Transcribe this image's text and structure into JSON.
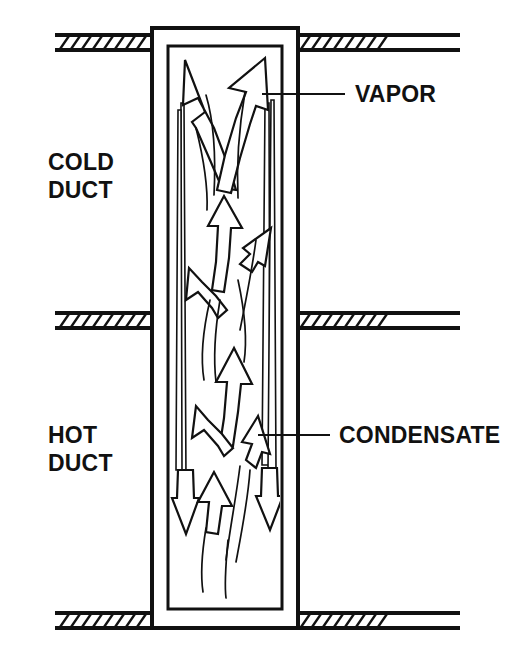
{
  "figure": {
    "background_color": "#ffffff",
    "line_color": "#111111"
  },
  "labels": {
    "cold_duct_line1": "COLD",
    "cold_duct_line2": "DUCT",
    "hot_duct_line1": "HOT",
    "hot_duct_line2": "DUCT",
    "vapor": "VAPOR",
    "condensate": "CONDENSATE"
  },
  "callouts": [
    {
      "name": "vapor",
      "text": "VAPOR",
      "leader_start_x": 262,
      "leader_end_x": 345,
      "leader_y": 94,
      "text_x": 355,
      "text_y": 102
    },
    {
      "name": "condensate",
      "text": "CONDENSATE",
      "leader_start_x": 258,
      "leader_end_x": 330,
      "leader_y": 435,
      "text_x": 339,
      "text_y": 443
    }
  ],
  "duct_labels": [
    {
      "name": "cold-duct",
      "line1": "COLD",
      "line2": "DUCT",
      "x": 48,
      "y1": 170,
      "y2": 198
    },
    {
      "name": "hot-duct",
      "line1": "HOT",
      "line2": "DUCT",
      "x": 48,
      "y1": 443,
      "y2": 471
    }
  ],
  "walls": [
    {
      "name": "top-wall",
      "y": 40,
      "left_span": [
        55,
        152
      ],
      "right_span": [
        296,
        460
      ],
      "hatch_left": [
        60,
        148
      ],
      "hatch_right": [
        300,
        400
      ]
    },
    {
      "name": "middle-wall",
      "y": 318,
      "left_span": [
        55,
        152
      ],
      "right_span": [
        296,
        460
      ],
      "hatch_left": [
        60,
        148
      ],
      "hatch_right": [
        300,
        400
      ]
    },
    {
      "name": "bottom-wall",
      "y": 618,
      "left_span": [
        55,
        152
      ],
      "right_span": [
        296,
        460
      ],
      "hatch_left": [
        60,
        148
      ],
      "hatch_right": [
        300,
        400
      ]
    }
  ],
  "tube": {
    "outer": {
      "x": 152,
      "y": 28,
      "width": 146,
      "height": 600
    },
    "inner": {
      "x": 168,
      "y": 46,
      "width": 114,
      "height": 563
    }
  },
  "flow": {
    "vapor_direction": "up",
    "condensate_direction": "down",
    "vapor_arrow_count": 8,
    "condensate_arrow_count": 4,
    "film_line_count": 12
  }
}
